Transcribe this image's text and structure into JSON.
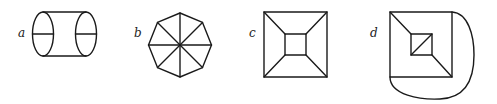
{
  "figures": [
    {
      "label": "a",
      "description": "cylinder with two elliptical ends, each bisected by a horizontal line"
    },
    {
      "label": "b",
      "description": "regular octagon divided into eight triangles by four diameters"
    },
    {
      "label": "c",
      "description": "square with inner square, corners connected by four diagonal segments"
    },
    {
      "label": "d",
      "description": "square with inner square, two corner connectors, inner diagonal and an outer curved edge"
    }
  ],
  "colors": {
    "stroke": "#1a1a1a",
    "background": "#ffffff"
  }
}
